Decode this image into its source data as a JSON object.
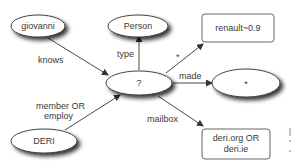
{
  "diagram": {
    "nodes": [
      {
        "id": "giovanni",
        "label": "giovanni",
        "shape": "ellipse"
      },
      {
        "id": "person",
        "label": "Person",
        "shape": "ellipse"
      },
      {
        "id": "renault",
        "label": "renault~0.9",
        "shape": "rect"
      },
      {
        "id": "center",
        "label": "?",
        "shape": "ellipse"
      },
      {
        "id": "star",
        "label": "*",
        "shape": "ellipse"
      },
      {
        "id": "deri",
        "label": "DERI",
        "shape": "ellipse"
      },
      {
        "id": "deriorg",
        "label_line1": "deri.org OR",
        "label_line2": "deri.ie",
        "shape": "rect"
      }
    ],
    "edges": [
      {
        "from": "giovanni",
        "to": "center",
        "label": "knows"
      },
      {
        "from": "center",
        "to": "person",
        "label": "type"
      },
      {
        "from": "center",
        "to": "renault",
        "label": "*"
      },
      {
        "from": "center",
        "to": "star",
        "label": "made"
      },
      {
        "from": "deri",
        "to": "center",
        "label_line1": "member OR",
        "label_line2": "employ"
      },
      {
        "from": "center",
        "to": "deriorg",
        "label": "mailbox"
      }
    ],
    "colors": {
      "stroke": "#333333",
      "text": "#3a3a3a",
      "shadow": "#555555"
    }
  }
}
